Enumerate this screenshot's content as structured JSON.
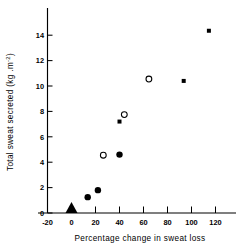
{
  "chart_data": {
    "type": "scatter",
    "title": "",
    "xlabel": "Percentage change in sweat loss",
    "ylabel": "Total sweat secreted (kg .m⁻²)",
    "xlim": [
      -20,
      125
    ],
    "ylim": [
      0,
      15.2
    ],
    "grid": false,
    "legend": "none",
    "xticks": [
      -20,
      0,
      20,
      40,
      60,
      80,
      100,
      120
    ],
    "xtick_labels": [
      "-20",
      "0",
      "20",
      "40",
      "60",
      "80",
      "100",
      "120"
    ],
    "yticks": [
      0,
      2,
      4,
      6,
      8,
      10,
      12,
      14
    ],
    "ytick_labels": [
      "0",
      "2",
      "4",
      "6",
      "8",
      "10",
      "12",
      "14"
    ],
    "series": [
      {
        "name": "filled-circle",
        "marker": "filled-circle",
        "points": [
          {
            "x": 13.5,
            "y": 1.25
          },
          {
            "x": 22.0,
            "y": 1.8
          },
          {
            "x": 40.0,
            "y": 4.6
          }
        ]
      },
      {
        "name": "open-circle",
        "marker": "open-circle",
        "points": [
          {
            "x": 26.5,
            "y": 4.55
          },
          {
            "x": 44.0,
            "y": 7.75
          },
          {
            "x": 64.5,
            "y": 10.55
          }
        ]
      },
      {
        "name": "filled-square",
        "marker": "filled-square",
        "points": [
          {
            "x": 40.0,
            "y": 7.2
          },
          {
            "x": 93.5,
            "y": 10.4
          },
          {
            "x": 114.5,
            "y": 14.35
          }
        ]
      },
      {
        "name": "origin-triangle",
        "marker": "filled-triangle",
        "points": [
          {
            "x": 0.0,
            "y": 0.0
          }
        ]
      }
    ]
  },
  "axis": {
    "x_title": "Percentage change in sweat loss",
    "y_title_main": "Total sweat secreted (kg .m",
    "y_title_sup": "-2",
    "y_title_end": ")"
  }
}
